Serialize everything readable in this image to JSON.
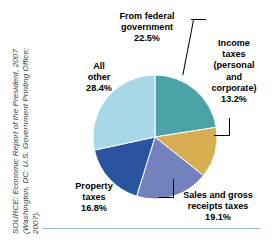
{
  "figure": {
    "source_line_1": "SOURCE: Economic Report of the President, 2007",
    "source_line_2": "(Washington, DC: U.S. Government Printing Office;",
    "source_line_3": "2007)."
  },
  "chart_data": {
    "type": "pie",
    "title": "",
    "legend_position": "callout-labels",
    "slices": [
      {
        "label": "From federal\ngovernment",
        "label_line_1": "From federal",
        "label_line_2": "government",
        "value": 22.5,
        "value_text": "22.5%",
        "color": "#4BA3A8",
        "color_name": "teal"
      },
      {
        "label": "Income taxes (personal and corporate)",
        "label_line_1": "Income",
        "label_line_2": "taxes",
        "label_line_3": "(personal",
        "label_line_4": "and",
        "label_line_5": "corporate)",
        "value": 13.2,
        "value_text": "13.2%",
        "color": "#D9AE52",
        "color_name": "gold"
      },
      {
        "label": "Sales and gross receipts taxes",
        "label_line_1": "Sales and gross",
        "label_line_2": "receipts taxes",
        "value": 19.1,
        "value_text": "19.1%",
        "color": "#7381BC",
        "color_name": "periwinkle"
      },
      {
        "label": "Property taxes",
        "label_line_1": "Property",
        "label_line_2": "taxes",
        "value": 16.8,
        "value_text": "16.8%",
        "color": "#2B54A0",
        "color_name": "navy-blue"
      },
      {
        "label": "All other",
        "label_line_1": "All",
        "label_line_2": "other",
        "value": 28.4,
        "value_text": "28.4%",
        "color": "#A8D8E8",
        "color_name": "light-blue"
      }
    ],
    "total": 100.0,
    "units": "percent",
    "start_angle_deg": 0,
    "direction": "clockwise"
  },
  "colors": {
    "rule": "#8fb6cc",
    "background": "#ffffff",
    "text": "#000000",
    "source_text": "#3a3a3a"
  }
}
